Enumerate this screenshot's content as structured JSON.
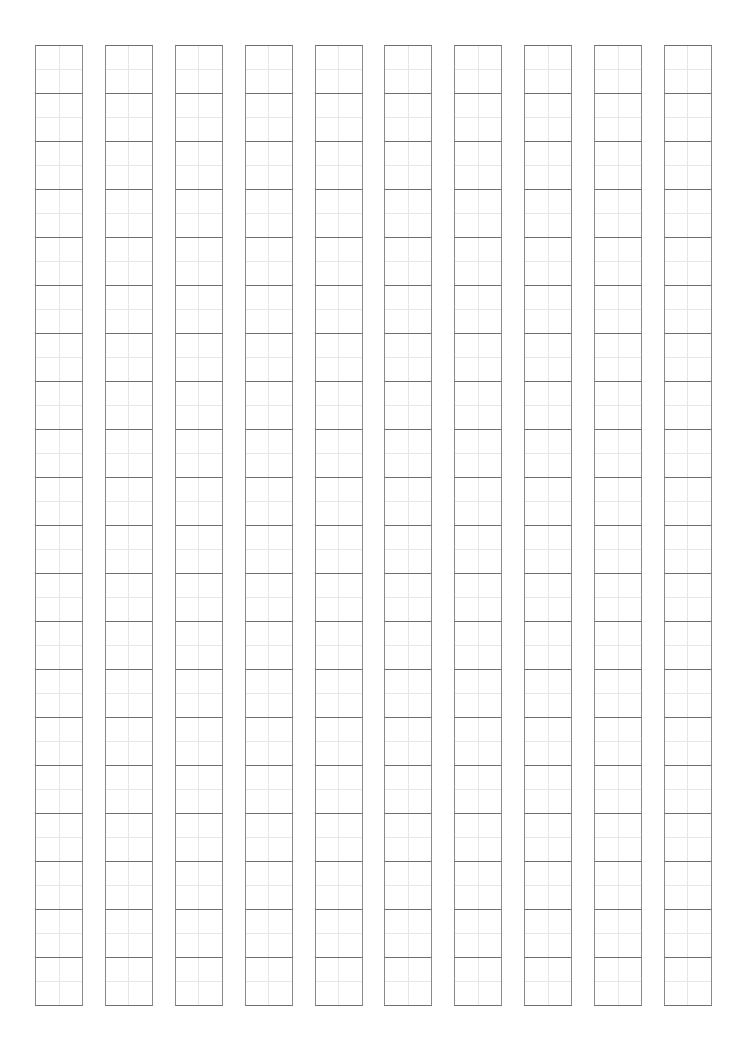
{
  "page": {
    "background_color": "#ffffff",
    "width": 736,
    "height": 1057
  },
  "sheet": {
    "name": "genko-yoshi-grid",
    "description": "Blank Japanese vertical manuscript writing paper",
    "columns": 10,
    "rows_per_column": 20,
    "cell_size_px": 48,
    "column_pitch_px": 67,
    "column_gap_px": 19,
    "origin_x_px": 35,
    "origin_y_px": 45,
    "grid_width_px": 677,
    "grid_height_px": 961,
    "reading_direction": "vertical-right-to-left",
    "colors": {
      "cell_border": "#8a8a8a",
      "cell_rule": "#6f6f6f",
      "center_guide": "#e6e6e6",
      "paper": "#ffffff"
    },
    "column_contents": [
      [
        "",
        "",
        "",
        "",
        "",
        "",
        "",
        "",
        "",
        "",
        "",
        "",
        "",
        "",
        "",
        "",
        "",
        "",
        "",
        ""
      ],
      [
        "",
        "",
        "",
        "",
        "",
        "",
        "",
        "",
        "",
        "",
        "",
        "",
        "",
        "",
        "",
        "",
        "",
        "",
        "",
        ""
      ],
      [
        "",
        "",
        "",
        "",
        "",
        "",
        "",
        "",
        "",
        "",
        "",
        "",
        "",
        "",
        "",
        "",
        "",
        "",
        "",
        ""
      ],
      [
        "",
        "",
        "",
        "",
        "",
        "",
        "",
        "",
        "",
        "",
        "",
        "",
        "",
        "",
        "",
        "",
        "",
        "",
        "",
        ""
      ],
      [
        "",
        "",
        "",
        "",
        "",
        "",
        "",
        "",
        "",
        "",
        "",
        "",
        "",
        "",
        "",
        "",
        "",
        "",
        "",
        ""
      ],
      [
        "",
        "",
        "",
        "",
        "",
        "",
        "",
        "",
        "",
        "",
        "",
        "",
        "",
        "",
        "",
        "",
        "",
        "",
        "",
        ""
      ],
      [
        "",
        "",
        "",
        "",
        "",
        "",
        "",
        "",
        "",
        "",
        "",
        "",
        "",
        "",
        "",
        "",
        "",
        "",
        "",
        ""
      ],
      [
        "",
        "",
        "",
        "",
        "",
        "",
        "",
        "",
        "",
        "",
        "",
        "",
        "",
        "",
        "",
        "",
        "",
        "",
        "",
        ""
      ],
      [
        "",
        "",
        "",
        "",
        "",
        "",
        "",
        "",
        "",
        "",
        "",
        "",
        "",
        "",
        "",
        "",
        "",
        "",
        "",
        ""
      ],
      [
        "",
        "",
        "",
        "",
        "",
        "",
        "",
        "",
        "",
        "",
        "",
        "",
        "",
        "",
        "",
        "",
        "",
        "",
        "",
        ""
      ]
    ]
  }
}
